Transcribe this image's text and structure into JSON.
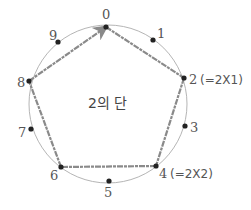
{
  "diagram": {
    "title": "2의 단",
    "circle": {
      "cx": 108,
      "cy": 104,
      "r": 79,
      "color": "#b5b5b5"
    },
    "edge_color": "#8a8a8a",
    "dot_color": "#222222",
    "label_color": "#555555",
    "points": [
      {
        "label": "0",
        "x": 106,
        "y": 27,
        "lx": 102,
        "ly": 19
      },
      {
        "label": "1",
        "x": 153,
        "y": 40,
        "lx": 157,
        "ly": 38
      },
      {
        "label": "2",
        "x": 184,
        "y": 78,
        "lx": 189,
        "ly": 84
      },
      {
        "label": "3",
        "x": 185,
        "y": 126,
        "lx": 190,
        "ly": 132
      },
      {
        "label": "4",
        "x": 156,
        "y": 166,
        "lx": 159,
        "ly": 178
      },
      {
        "label": "5",
        "x": 109,
        "y": 181,
        "lx": 104,
        "ly": 197
      },
      {
        "label": "6",
        "x": 61,
        "y": 167,
        "lx": 50,
        "ly": 180
      },
      {
        "label": "7",
        "x": 31,
        "y": 129,
        "lx": 18,
        "ly": 137
      },
      {
        "label": "8",
        "x": 29,
        "y": 81,
        "lx": 17,
        "ly": 87
      },
      {
        "label": "9",
        "x": 58,
        "y": 42,
        "lx": 49,
        "ly": 40
      }
    ],
    "annotations": [
      {
        "point": "2",
        "text": "(=2X1)",
        "x": 200,
        "y": 84
      },
      {
        "point": "4",
        "text": "(=2X2)",
        "x": 170,
        "y": 178
      }
    ],
    "path_sequence": [
      "0",
      "2",
      "4",
      "6",
      "8",
      "0"
    ]
  }
}
